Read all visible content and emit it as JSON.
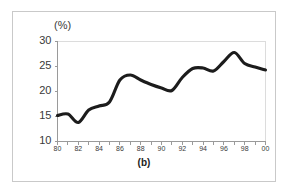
{
  "figure": {
    "caption": "(b)",
    "unit_label": "(%)",
    "border_color": "#c9c9c9",
    "background_color": "#ffffff"
  },
  "chart_data": {
    "type": "line",
    "title": "",
    "subtitle": "",
    "xlabel": "",
    "ylabel": "(%)",
    "unit": "%",
    "grid": true,
    "legend": "none",
    "line_color": "#1c1c1c",
    "axis_color": "#9a9a9a",
    "xlim": [
      80,
      100
    ],
    "ylim": [
      10,
      30
    ],
    "yticks": [
      10,
      15,
      20,
      25,
      30
    ],
    "ytick_labels": [
      "10",
      "15",
      "20",
      "25",
      "30"
    ],
    "xticks": [
      80,
      81,
      82,
      83,
      84,
      85,
      86,
      87,
      88,
      89,
      90,
      91,
      92,
      93,
      94,
      95,
      96,
      97,
      98,
      99,
      100
    ],
    "xtick_labels": [
      "80",
      "",
      "82",
      "",
      "84",
      "",
      "86",
      "",
      "88",
      "",
      "90",
      "",
      "92",
      "",
      "94",
      "",
      "96",
      "",
      "98",
      "",
      "00"
    ],
    "x": [
      80,
      81,
      82,
      83,
      84,
      85,
      86,
      87,
      88,
      89,
      90,
      91,
      92,
      93,
      94,
      95,
      96,
      97,
      98,
      99,
      100
    ],
    "categories": [
      "80",
      "81",
      "82",
      "83",
      "84",
      "85",
      "86",
      "87",
      "88",
      "89",
      "90",
      "91",
      "92",
      "93",
      "94",
      "95",
      "96",
      "97",
      "98",
      "99",
      "00"
    ],
    "values": [
      15.2,
      15.5,
      13.8,
      16.3,
      17.1,
      17.9,
      22.3,
      23.3,
      22.3,
      21.4,
      20.7,
      20.2,
      22.8,
      24.6,
      24.7,
      24.1,
      26.0,
      27.8,
      25.6,
      24.9,
      24.3
    ]
  }
}
